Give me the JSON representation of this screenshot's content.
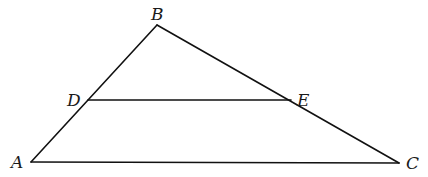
{
  "diagram": {
    "type": "triangle-with-midline",
    "points": {
      "A": {
        "label": "A",
        "x": 31,
        "y": 162
      },
      "B": {
        "label": "B",
        "x": 157,
        "y": 25
      },
      "C": {
        "label": "C",
        "x": 399,
        "y": 163
      },
      "D": {
        "label": "D",
        "x": 88,
        "y": 100
      },
      "E": {
        "label": "E",
        "x": 291,
        "y": 100
      }
    },
    "segments": [
      {
        "name": "AB",
        "from": "A",
        "to": "B"
      },
      {
        "name": "BC",
        "from": "B",
        "to": "C"
      },
      {
        "name": "AC",
        "from": "A",
        "to": "C"
      },
      {
        "name": "DE",
        "from": "D",
        "to": "E"
      }
    ],
    "labels": {
      "A": "A",
      "B": "B",
      "C": "C",
      "D": "D",
      "E": "E"
    },
    "stroke_color": "#111111",
    "background": "#ffffff"
  }
}
